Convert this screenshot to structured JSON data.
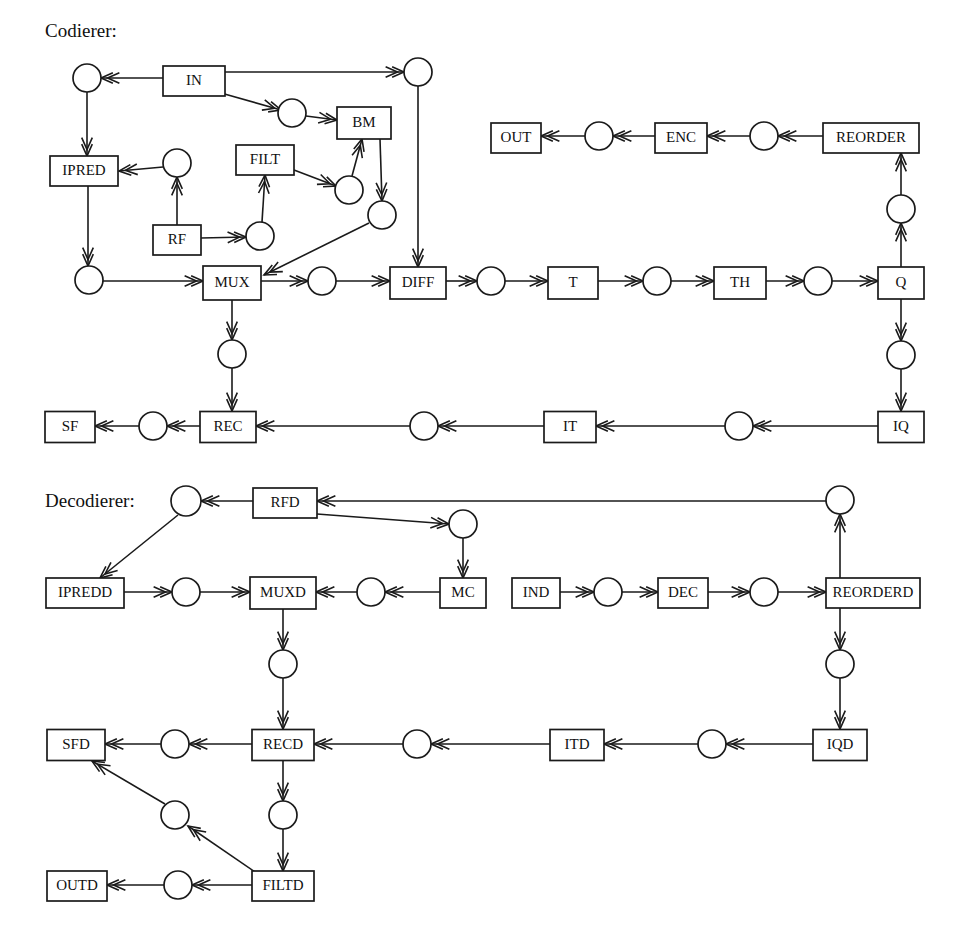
{
  "figure": {
    "title_encoder": "Codierer:",
    "title_decoder": "Decodierer:",
    "width": 963,
    "height": 946,
    "stroke_color": "#1a1a1a",
    "fill_color": "#ffffff"
  },
  "sections": [
    {
      "id": "encoder",
      "label": "Codierer:",
      "x": 45,
      "y": 33
    },
    {
      "id": "decoder",
      "label": "Decodierer:",
      "x": 45,
      "y": 503
    }
  ],
  "boxes": [
    {
      "id": "IN",
      "label": "IN",
      "cx": 194,
      "cy": 81,
      "w": 62,
      "h": 30
    },
    {
      "id": "BM",
      "label": "BM",
      "cx": 364,
      "cy": 123,
      "w": 54,
      "h": 32
    },
    {
      "id": "IPRED",
      "label": "IPRED",
      "cx": 84,
      "cy": 171,
      "w": 68,
      "h": 30
    },
    {
      "id": "FILT",
      "label": "FILT",
      "cx": 265,
      "cy": 160,
      "w": 58,
      "h": 30
    },
    {
      "id": "RF",
      "label": "RF",
      "cx": 177,
      "cy": 240,
      "w": 48,
      "h": 30
    },
    {
      "id": "MUX",
      "label": "MUX",
      "cx": 232,
      "cy": 283,
      "w": 58,
      "h": 34
    },
    {
      "id": "DIFF",
      "label": "DIFF",
      "cx": 418,
      "cy": 283,
      "w": 56,
      "h": 32
    },
    {
      "id": "T",
      "label": "T",
      "cx": 573,
      "cy": 283,
      "w": 50,
      "h": 32
    },
    {
      "id": "TH",
      "label": "TH",
      "cx": 740,
      "cy": 283,
      "w": 52,
      "h": 32
    },
    {
      "id": "Q",
      "label": "Q",
      "cx": 901,
      "cy": 283,
      "w": 46,
      "h": 32
    },
    {
      "id": "OUT",
      "label": "OUT",
      "cx": 516,
      "cy": 138,
      "w": 50,
      "h": 30
    },
    {
      "id": "ENC",
      "label": "ENC",
      "cx": 681,
      "cy": 138,
      "w": 52,
      "h": 30
    },
    {
      "id": "REORDER",
      "label": "REORDER",
      "cx": 871,
      "cy": 138,
      "w": 96,
      "h": 30
    },
    {
      "id": "SF",
      "label": "SF",
      "cx": 70,
      "cy": 427,
      "w": 50,
      "h": 31
    },
    {
      "id": "REC",
      "label": "REC",
      "cx": 228,
      "cy": 427,
      "w": 56,
      "h": 31
    },
    {
      "id": "IT",
      "label": "IT",
      "cx": 570,
      "cy": 427,
      "w": 52,
      "h": 31
    },
    {
      "id": "IQ",
      "label": "IQ",
      "cx": 901,
      "cy": 427,
      "w": 46,
      "h": 31
    },
    {
      "id": "RFD",
      "label": "RFD",
      "cx": 285,
      "cy": 503,
      "w": 64,
      "h": 30
    },
    {
      "id": "IPREDD",
      "label": "IPREDD",
      "cx": 85,
      "cy": 593,
      "w": 78,
      "h": 30
    },
    {
      "id": "MUXD",
      "label": "MUXD",
      "cx": 283,
      "cy": 593,
      "w": 66,
      "h": 32
    },
    {
      "id": "MC",
      "label": "MC",
      "cx": 463,
      "cy": 593,
      "w": 46,
      "h": 30
    },
    {
      "id": "IND",
      "label": "IND",
      "cx": 536,
      "cy": 593,
      "w": 48,
      "h": 30
    },
    {
      "id": "DEC",
      "label": "DEC",
      "cx": 683,
      "cy": 593,
      "w": 50,
      "h": 30
    },
    {
      "id": "REORDERD",
      "label": "REORDERD",
      "cx": 873,
      "cy": 593,
      "w": 94,
      "h": 30
    },
    {
      "id": "SFD",
      "label": "SFD",
      "cx": 76,
      "cy": 745,
      "w": 58,
      "h": 31
    },
    {
      "id": "RECD",
      "label": "RECD",
      "cx": 283,
      "cy": 745,
      "w": 62,
      "h": 31
    },
    {
      "id": "ITD",
      "label": "ITD",
      "cx": 577,
      "cy": 745,
      "w": 54,
      "h": 31
    },
    {
      "id": "IQD",
      "label": "IQD",
      "cx": 840,
      "cy": 745,
      "w": 54,
      "h": 31
    },
    {
      "id": "OUTD",
      "label": "OUTD",
      "cx": 77,
      "cy": 886,
      "w": 60,
      "h": 30
    },
    {
      "id": "FILTD",
      "label": "FILTD",
      "cx": 283,
      "cy": 886,
      "w": 62,
      "h": 30
    }
  ],
  "circles": [
    {
      "id": "c_in_left",
      "cx": 87,
      "cy": 78,
      "r": 14
    },
    {
      "id": "c_in_bm",
      "cx": 292,
      "cy": 113,
      "r": 14
    },
    {
      "id": "c_in_right",
      "cx": 418,
      "cy": 72,
      "r": 14
    },
    {
      "id": "c_ipred_in",
      "cx": 177,
      "cy": 163,
      "r": 14
    },
    {
      "id": "c_filt_bm",
      "cx": 349,
      "cy": 190,
      "r": 14
    },
    {
      "id": "c_bm_out",
      "cx": 382,
      "cy": 215,
      "r": 14
    },
    {
      "id": "c_rf_filt",
      "cx": 260,
      "cy": 236,
      "r": 14
    },
    {
      "id": "c_ipred_out",
      "cx": 89,
      "cy": 280,
      "r": 14
    },
    {
      "id": "c_mux_diff",
      "cx": 322,
      "cy": 281,
      "r": 14
    },
    {
      "id": "c_diff_t",
      "cx": 491,
      "cy": 281,
      "r": 14
    },
    {
      "id": "c_t_th",
      "cx": 657,
      "cy": 281,
      "r": 14
    },
    {
      "id": "c_th_q",
      "cx": 818,
      "cy": 281,
      "r": 14
    },
    {
      "id": "c_q_reorder",
      "cx": 901,
      "cy": 209,
      "r": 14
    },
    {
      "id": "c_reorder_enc",
      "cx": 764,
      "cy": 136,
      "r": 14
    },
    {
      "id": "c_enc_out",
      "cx": 599,
      "cy": 136,
      "r": 14
    },
    {
      "id": "c_q_iq",
      "cx": 901,
      "cy": 355,
      "r": 14
    },
    {
      "id": "c_iq_it",
      "cx": 739,
      "cy": 426,
      "r": 14
    },
    {
      "id": "c_it_rec",
      "cx": 424,
      "cy": 426,
      "r": 14
    },
    {
      "id": "c_rec_sf",
      "cx": 153,
      "cy": 426,
      "r": 14
    },
    {
      "id": "c_rec_mux",
      "cx": 232,
      "cy": 354,
      "r": 14
    },
    {
      "id": "c_rfd_left",
      "cx": 186,
      "cy": 501,
      "r": 15
    },
    {
      "id": "c_rfd_mc",
      "cx": 463,
      "cy": 524,
      "r": 14
    },
    {
      "id": "c_reorderd_up",
      "cx": 840,
      "cy": 500,
      "r": 14
    },
    {
      "id": "c_ipredd_mux",
      "cx": 186,
      "cy": 592,
      "r": 14
    },
    {
      "id": "c_mc_muxd",
      "cx": 371,
      "cy": 592,
      "r": 14
    },
    {
      "id": "c_ind_dec",
      "cx": 608,
      "cy": 592,
      "r": 14
    },
    {
      "id": "c_dec_reord",
      "cx": 764,
      "cy": 592,
      "r": 14
    },
    {
      "id": "c_muxd_recd",
      "cx": 283,
      "cy": 664,
      "r": 14
    },
    {
      "id": "c_reorderd_dn",
      "cx": 840,
      "cy": 664,
      "r": 14
    },
    {
      "id": "c_iqd_itd",
      "cx": 712,
      "cy": 744,
      "r": 14
    },
    {
      "id": "c_itd_recd",
      "cx": 417,
      "cy": 744,
      "r": 14
    },
    {
      "id": "c_recd_sfd",
      "cx": 175,
      "cy": 744,
      "r": 14
    },
    {
      "id": "c_recd_filtd",
      "cx": 283,
      "cy": 815,
      "r": 14
    },
    {
      "id": "c_filtd_sfd",
      "cx": 175,
      "cy": 815,
      "r": 14
    },
    {
      "id": "c_filtd_outd",
      "cx": 178,
      "cy": 885,
      "r": 14
    }
  ],
  "edges": [
    {
      "id": "e1",
      "from": "IN",
      "to": "c_in_left",
      "path": "163,78 101,78",
      "arrow": "end"
    },
    {
      "id": "e2",
      "from": "IN",
      "to": "c_in_right",
      "path": "225,72 404,72",
      "arrow": "end"
    },
    {
      "id": "e3",
      "from": "IN",
      "to": "c_in_bm",
      "path": "221,93 281,110",
      "arrow": "end"
    },
    {
      "id": "e4",
      "from": "c_in_bm",
      "to": "BM",
      "path": "306,116 337,120",
      "arrow": "end"
    },
    {
      "id": "e5",
      "from": "c_in_left",
      "to": "IPRED",
      "path": "87,92 87,156",
      "arrow": "end"
    },
    {
      "id": "e6",
      "from": "c_ipred_in",
      "to": "IPRED",
      "path": "163,167 119,171",
      "arrow": "end"
    },
    {
      "id": "e7",
      "from": "RF",
      "to": "c_ipred_in",
      "path": "177,225 177,177",
      "arrow": "end"
    },
    {
      "id": "e8",
      "from": "RF",
      "to": "c_rf_filt",
      "path": "201,238 246,237",
      "arrow": "end"
    },
    {
      "id": "e9",
      "from": "c_rf_filt",
      "to": "FILT",
      "path": "262,222 265,175",
      "arrow": "end"
    },
    {
      "id": "e10",
      "from": "FILT",
      "to": "c_filt_bm",
      "path": "294,170 336,186",
      "arrow": "end"
    },
    {
      "id": "e11",
      "from": "c_filt_bm",
      "to": "BM",
      "path": "352,176 362,139",
      "arrow": "end"
    },
    {
      "id": "e12",
      "from": "BM",
      "to": "c_bm_out",
      "path": "380,139 382,201",
      "arrow": "end"
    },
    {
      "id": "e13",
      "from": "c_bm_out",
      "to": "MUX",
      "path": "369,223 264,275",
      "arrow": "end"
    },
    {
      "id": "e14",
      "from": "IPRED",
      "to": "c_ipred_out",
      "path": "88,186 88,266",
      "arrow": "end"
    },
    {
      "id": "e15",
      "from": "c_ipred_out",
      "to": "MUX",
      "path": "103,281 203,281",
      "arrow": "end"
    },
    {
      "id": "e16",
      "from": "MUX",
      "to": "c_mux_diff",
      "path": "261,281 308,281",
      "arrow": "end"
    },
    {
      "id": "e17",
      "from": "c_mux_diff",
      "to": "DIFF",
      "path": "336,281 390,281",
      "arrow": "end"
    },
    {
      "id": "e18",
      "from": "c_in_right",
      "to": "DIFF",
      "path": "418,86 418,267",
      "arrow": "end"
    },
    {
      "id": "e19",
      "from": "DIFF",
      "to": "c_diff_t",
      "path": "446,281 477,281",
      "arrow": "end"
    },
    {
      "id": "e20",
      "from": "c_diff_t",
      "to": "T",
      "path": "505,281 548,281",
      "arrow": "end"
    },
    {
      "id": "e21",
      "from": "T",
      "to": "c_t_th",
      "path": "598,281 643,281",
      "arrow": "end"
    },
    {
      "id": "e22",
      "from": "c_t_th",
      "to": "TH",
      "path": "671,281 714,281",
      "arrow": "end"
    },
    {
      "id": "e23",
      "from": "TH",
      "to": "c_th_q",
      "path": "766,281 804,281",
      "arrow": "end"
    },
    {
      "id": "e24",
      "from": "c_th_q",
      "to": "Q",
      "path": "832,281 878,281",
      "arrow": "end"
    },
    {
      "id": "e25",
      "from": "Q",
      "to": "c_q_reorder",
      "path": "901,267 901,223",
      "arrow": "end"
    },
    {
      "id": "e26",
      "from": "c_q_reorder",
      "to": "REORDER",
      "path": "901,195 901,153",
      "arrow": "end"
    },
    {
      "id": "e27",
      "from": "REORDER",
      "to": "c_reorder_enc",
      "path": "823,136 778,136",
      "arrow": "end"
    },
    {
      "id": "e28",
      "from": "c_reorder_enc",
      "to": "ENC",
      "path": "750,136 707,136",
      "arrow": "end"
    },
    {
      "id": "e29",
      "from": "ENC",
      "to": "c_enc_out",
      "path": "655,136 613,136",
      "arrow": "end"
    },
    {
      "id": "e30",
      "from": "c_enc_out",
      "to": "OUT",
      "path": "585,136 541,136",
      "arrow": "end"
    },
    {
      "id": "e31",
      "from": "Q",
      "to": "c_q_iq",
      "path": "901,299 901,341",
      "arrow": "end"
    },
    {
      "id": "e32",
      "from": "c_q_iq",
      "to": "IQ",
      "path": "901,369 901,411",
      "arrow": "end"
    },
    {
      "id": "e33",
      "from": "IQ",
      "to": "c_iq_it",
      "path": "878,426 753,426",
      "arrow": "end"
    },
    {
      "id": "e34",
      "from": "c_iq_it",
      "to": "IT",
      "path": "725,426 596,426",
      "arrow": "end"
    },
    {
      "id": "e35",
      "from": "IT",
      "to": "c_it_rec",
      "path": "544,426 438,426",
      "arrow": "end"
    },
    {
      "id": "e36",
      "from": "c_it_rec",
      "to": "REC",
      "path": "410,426 256,426",
      "arrow": "end"
    },
    {
      "id": "e37",
      "from": "REC",
      "to": "c_rec_sf",
      "path": "200,426 167,426",
      "arrow": "end"
    },
    {
      "id": "e38",
      "from": "c_rec_sf",
      "to": "SF",
      "path": "139,426 95,426",
      "arrow": "end"
    },
    {
      "id": "e39",
      "from": "MUX",
      "to": "c_rec_mux",
      "path": "232,300 232,340",
      "arrow": "end"
    },
    {
      "id": "e40",
      "from": "c_rec_mux",
      "to": "REC",
      "path": "232,368 232,411",
      "arrow": "end"
    },
    {
      "id": "e41",
      "from": "RFD",
      "to": "c_rfd_left",
      "path": "253,501 201,501",
      "arrow": "end"
    },
    {
      "id": "e42",
      "from": "c_reorderd_up",
      "to": "RFD",
      "path": "826,501 317,501",
      "arrow": "end"
    },
    {
      "id": "e43",
      "from": "RFD",
      "to": "c_rfd_mc",
      "path": "317,514 449,524",
      "arrow": "end"
    },
    {
      "id": "e44",
      "from": "c_rfd_mc",
      "to": "MC",
      "path": "463,538 463,578",
      "arrow": "end"
    },
    {
      "id": "e45",
      "from": "c_rfd_left",
      "to": "IPREDD",
      "path": "178,515 100,578",
      "arrow": "end"
    },
    {
      "id": "e46",
      "from": "IPREDD",
      "to": "c_ipredd_mux",
      "path": "124,592 172,592",
      "arrow": "end"
    },
    {
      "id": "e47",
      "from": "c_ipredd_mux",
      "to": "MUXD",
      "path": "200,592 250,592",
      "arrow": "end"
    },
    {
      "id": "e48",
      "from": "MC",
      "to": "c_mc_muxd",
      "path": "440,592 385,592",
      "arrow": "end"
    },
    {
      "id": "e49",
      "from": "c_mc_muxd",
      "to": "MUXD",
      "path": "357,592 316,592",
      "arrow": "end"
    },
    {
      "id": "e50",
      "from": "IND",
      "to": "c_ind_dec",
      "path": "560,592 594,592",
      "arrow": "end"
    },
    {
      "id": "e51",
      "from": "c_ind_dec",
      "to": "DEC",
      "path": "622,592 658,592",
      "arrow": "end"
    },
    {
      "id": "e52",
      "from": "DEC",
      "to": "c_dec_reord",
      "path": "708,592 750,592",
      "arrow": "end"
    },
    {
      "id": "e53",
      "from": "c_dec_reord",
      "to": "REORDERD",
      "path": "778,592 826,592",
      "arrow": "end"
    },
    {
      "id": "e54",
      "from": "REORDERD",
      "to": "c_reorderd_up",
      "path": "840,578 840,514",
      "arrow": "end"
    },
    {
      "id": "e55",
      "from": "REORDERD",
      "to": "c_reorderd_dn",
      "path": "840,608 840,650",
      "arrow": "end"
    },
    {
      "id": "e56",
      "from": "c_reorderd_dn",
      "to": "IQD",
      "path": "840,678 840,729",
      "arrow": "end"
    },
    {
      "id": "e57",
      "from": "IQD",
      "to": "c_iqd_itd",
      "path": "813,744 726,744",
      "arrow": "end"
    },
    {
      "id": "e58",
      "from": "c_iqd_itd",
      "to": "ITD",
      "path": "698,744 604,744",
      "arrow": "end"
    },
    {
      "id": "e59",
      "from": "ITD",
      "to": "c_itd_recd",
      "path": "550,744 431,744",
      "arrow": "end"
    },
    {
      "id": "e60",
      "from": "c_itd_recd",
      "to": "RECD",
      "path": "403,744 314,744",
      "arrow": "end"
    },
    {
      "id": "e61",
      "from": "RECD",
      "to": "c_recd_sfd",
      "path": "252,744 189,744",
      "arrow": "end"
    },
    {
      "id": "e62",
      "from": "c_recd_sfd",
      "to": "SFD",
      "path": "161,744 105,744",
      "arrow": "end"
    },
    {
      "id": "e63",
      "from": "MUXD",
      "to": "c_muxd_recd",
      "path": "283,609 283,650",
      "arrow": "end"
    },
    {
      "id": "e64",
      "from": "c_muxd_recd",
      "to": "RECD",
      "path": "283,678 283,729",
      "arrow": "end"
    },
    {
      "id": "e65",
      "from": "RECD",
      "to": "c_recd_filtd",
      "path": "283,761 283,801",
      "arrow": "end"
    },
    {
      "id": "e66",
      "from": "c_recd_filtd",
      "to": "FILTD",
      "path": "283,829 283,871",
      "arrow": "end"
    },
    {
      "id": "e67",
      "from": "FILTD",
      "to": "c_filtd_outd",
      "path": "252,885 192,885",
      "arrow": "end"
    },
    {
      "id": "e68",
      "from": "c_filtd_outd",
      "to": "OUTD",
      "path": "164,885 107,885",
      "arrow": "end"
    },
    {
      "id": "e69",
      "from": "FILTD",
      "to": "c_filtd_sfd",
      "path": "258,874 188,826",
      "arrow": "end"
    },
    {
      "id": "e70",
      "from": "c_filtd_sfd",
      "to": "SFD",
      "path": "165,804 92,761",
      "arrow": "end"
    }
  ]
}
